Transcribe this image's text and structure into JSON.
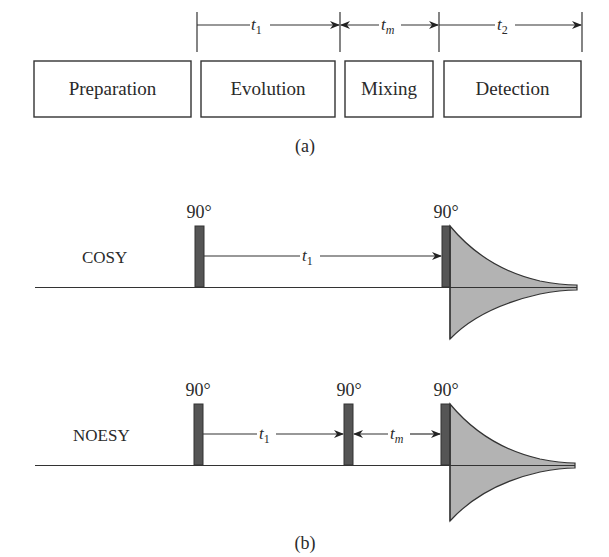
{
  "panel_a": {
    "caption": "(a)",
    "timing": [
      {
        "symbol": "t",
        "subscript": "1"
      },
      {
        "symbol": "t",
        "subscript": "m"
      },
      {
        "symbol": "t",
        "subscript": "2"
      }
    ],
    "boxes": [
      {
        "label": "Preparation"
      },
      {
        "label": "Evolution"
      },
      {
        "label": "Mixing"
      },
      {
        "label": "Detection"
      }
    ]
  },
  "panel_b": {
    "caption": "(b)",
    "sequences": [
      {
        "name": "COSY",
        "pulses": [
          {
            "angle": "90°"
          },
          {
            "angle": "90°"
          }
        ],
        "delays": [
          {
            "symbol": "t",
            "subscript": "1"
          }
        ]
      },
      {
        "name": "NOESY",
        "pulses": [
          {
            "angle": "90°"
          },
          {
            "angle": "90°"
          },
          {
            "angle": "90°"
          }
        ],
        "delays": [
          {
            "symbol": "t",
            "subscript": "1"
          },
          {
            "symbol": "t",
            "subscript": "m"
          }
        ]
      }
    ]
  },
  "colors": {
    "line": "#333333",
    "pulse_fill": "#555555",
    "fid_fill": "#b3b3b3",
    "background": "#ffffff"
  }
}
